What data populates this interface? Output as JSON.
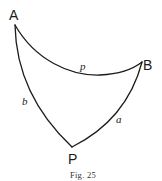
{
  "figure": {
    "caption": "Fig. 25",
    "vertices": [
      {
        "id": "A",
        "label": "A"
      },
      {
        "id": "B",
        "label": "B"
      },
      {
        "id": "P",
        "label": "P"
      }
    ],
    "edges": [
      {
        "id": "p",
        "label": "p",
        "from": "A",
        "to": "B"
      },
      {
        "id": "b",
        "label": "b",
        "from": "A",
        "to": "P"
      },
      {
        "id": "a",
        "label": "a",
        "from": "B",
        "to": "P"
      }
    ],
    "colors": {
      "stroke": "#1a1a1a",
      "background": "#ffffff"
    }
  }
}
